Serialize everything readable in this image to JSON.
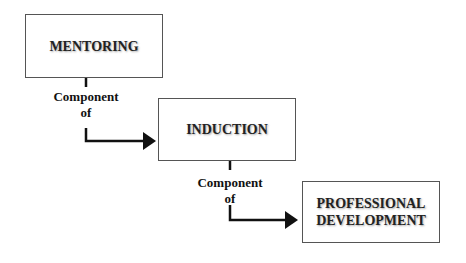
{
  "diagram": {
    "nodes": [
      {
        "id": "mentoring",
        "label": "MENTORING"
      },
      {
        "id": "induction",
        "label": "INDUCTION"
      },
      {
        "id": "professional",
        "label_line1": "PROFESSIONAL",
        "label_line2": "DEVELOPMENT"
      }
    ],
    "edges": [
      {
        "from": "mentoring",
        "to": "induction",
        "label_line1": "Component",
        "label_line2": "of"
      },
      {
        "from": "induction",
        "to": "professional",
        "label_line1": "Component",
        "label_line2": "of"
      }
    ],
    "colors": {
      "border": "#555555",
      "arrow": "#111111",
      "text": "#222222"
    }
  }
}
